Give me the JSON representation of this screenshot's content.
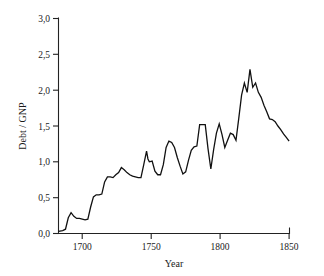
{
  "chart_data": {
    "type": "line",
    "title": "",
    "subtitle": "",
    "xlabel": "Year",
    "ylabel": "Debt / GNP",
    "xlim": [
      1685,
      1850
    ],
    "ylim": [
      0.0,
      3.0
    ],
    "grid": false,
    "legend": null,
    "decimal_separator": ",",
    "x_ticks": [
      1700,
      1750,
      1800,
      1850
    ],
    "x_tick_labels": [
      "1700",
      "1750",
      "1800",
      "1850"
    ],
    "y_ticks": [
      0.0,
      0.5,
      1.0,
      1.5,
      2.0,
      2.5,
      3.0
    ],
    "y_tick_labels": [
      "0,0",
      "0,5",
      "1,0",
      "1,5",
      "2,0",
      "2,5",
      "3,0"
    ],
    "series": [
      {
        "name": "Debt / GNP",
        "color": "#111111",
        "x": [
          1685,
          1688,
          1690,
          1692,
          1694,
          1696,
          1698,
          1700,
          1702,
          1704,
          1706,
          1708,
          1710,
          1712,
          1714,
          1716,
          1718,
          1720,
          1722,
          1724,
          1726,
          1728,
          1730,
          1732,
          1734,
          1736,
          1738,
          1740,
          1742,
          1744,
          1746,
          1748,
          1749,
          1750,
          1752,
          1754,
          1756,
          1758,
          1760,
          1762,
          1764,
          1766,
          1768,
          1770,
          1772,
          1774,
          1776,
          1778,
          1780,
          1782,
          1784,
          1786,
          1788,
          1790,
          1792,
          1794,
          1796,
          1798,
          1800,
          1802,
          1804,
          1806,
          1808,
          1810,
          1812,
          1814,
          1816,
          1818,
          1820,
          1822,
          1824,
          1826,
          1828,
          1830,
          1832,
          1834,
          1836,
          1838,
          1840,
          1842,
          1844,
          1846,
          1848,
          1850
        ],
        "y": [
          0.03,
          0.04,
          0.06,
          0.22,
          0.29,
          0.24,
          0.21,
          0.21,
          0.2,
          0.19,
          0.2,
          0.37,
          0.51,
          0.54,
          0.54,
          0.55,
          0.72,
          0.79,
          0.79,
          0.78,
          0.82,
          0.85,
          0.92,
          0.89,
          0.85,
          0.82,
          0.8,
          0.79,
          0.78,
          0.78,
          0.96,
          1.15,
          1.04,
          1.0,
          1.01,
          0.87,
          0.82,
          0.82,
          0.96,
          1.2,
          1.29,
          1.27,
          1.2,
          1.06,
          0.94,
          0.83,
          0.86,
          1.02,
          1.16,
          1.21,
          1.22,
          1.52,
          1.52,
          1.52,
          1.18,
          0.9,
          1.17,
          1.4,
          1.53,
          1.38,
          1.2,
          1.3,
          1.4,
          1.38,
          1.3,
          1.61,
          1.93,
          2.1,
          1.97,
          2.29,
          2.04,
          2.1,
          1.97,
          1.9,
          1.79,
          1.7,
          1.6,
          1.59,
          1.56,
          1.5,
          1.45,
          1.39,
          1.34,
          1.29
        ]
      }
    ]
  },
  "axes": {
    "y_label_text": "Debt / GNP",
    "x_label_text": "Year"
  }
}
